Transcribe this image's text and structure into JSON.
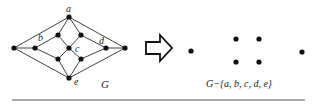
{
  "figure": {
    "left_graph": {
      "caption": "G",
      "vertex_labels": [
        "a",
        "b",
        "c",
        "d",
        "e"
      ],
      "vertices": [
        {
          "id": "L",
          "x": 14,
          "y": 48
        },
        {
          "id": "b",
          "x": 35,
          "y": 48,
          "label": "b"
        },
        {
          "id": "a",
          "x": 69,
          "y": 17,
          "label": "a"
        },
        {
          "id": "ul",
          "x": 58,
          "y": 35
        },
        {
          "id": "ur",
          "x": 81,
          "y": 35
        },
        {
          "id": "c",
          "x": 69,
          "y": 48,
          "label": "c"
        },
        {
          "id": "ll",
          "x": 58,
          "y": 59
        },
        {
          "id": "lr",
          "x": 81,
          "y": 59
        },
        {
          "id": "e",
          "x": 69,
          "y": 78,
          "label": "e"
        },
        {
          "id": "d",
          "x": 106,
          "y": 48,
          "label": "d"
        },
        {
          "id": "R",
          "x": 125,
          "y": 48
        }
      ]
    },
    "arrow": {
      "direction": "right",
      "style": "outline"
    },
    "right_graph": {
      "caption": "G−{a, b, c, d, e}",
      "isolated_vertex_count": 6
    }
  }
}
